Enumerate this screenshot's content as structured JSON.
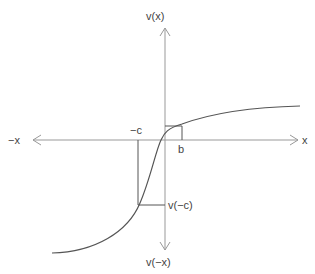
{
  "diagram": {
    "type": "function-plot-sketch",
    "axes": {
      "x_positive_label": "x",
      "x_negative_label": "−x",
      "y_positive_label": "v(x)",
      "y_negative_label": "v(−x)"
    },
    "annotations": {
      "neg_c_label": "−c",
      "b_label": "b",
      "v_neg_c_label": "v(−c)"
    },
    "colors": {
      "axis": "#999999",
      "curve": "#555555",
      "guide": "#555555",
      "text": "#444444"
    }
  }
}
